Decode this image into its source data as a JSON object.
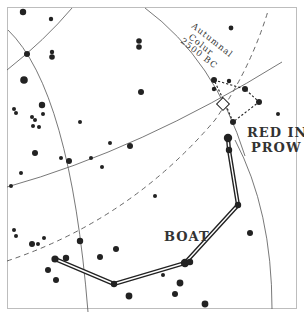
{
  "diagram": {
    "type": "star-chart",
    "labels": {
      "colure_line1": "Autumnal",
      "colure_line2": "Colur",
      "colure_line3": "2500 BC",
      "red_in_prow_line1": "RED IN",
      "red_in_prow_line2": "PROW",
      "boat": "BOAT"
    },
    "colors": {
      "ink": "#222222",
      "grid": "#555555",
      "frame": "#bdbdbd",
      "background": "#ffffff"
    },
    "stars": [
      {
        "x": 23,
        "y": 12,
        "r": 3.2
      },
      {
        "x": 51,
        "y": 19,
        "r": 2.2
      },
      {
        "x": 27,
        "y": 54,
        "r": 3.0
      },
      {
        "x": 52,
        "y": 52,
        "r": 2.2
      },
      {
        "x": 52,
        "y": 57,
        "r": 2.8
      },
      {
        "x": 24,
        "y": 80,
        "r": 3.8
      },
      {
        "x": 139,
        "y": 41,
        "r": 2.8
      },
      {
        "x": 139,
        "y": 47,
        "r": 2.8
      },
      {
        "x": 141,
        "y": 92,
        "r": 3.0
      },
      {
        "x": 42,
        "y": 105,
        "r": 3.2
      },
      {
        "x": 14,
        "y": 109,
        "r": 2.0
      },
      {
        "x": 16,
        "y": 113,
        "r": 2.0
      },
      {
        "x": 43,
        "y": 114,
        "r": 2.0
      },
      {
        "x": 32,
        "y": 117,
        "r": 2.0
      },
      {
        "x": 35,
        "y": 120,
        "r": 2.0
      },
      {
        "x": 33,
        "y": 126,
        "r": 2.0
      },
      {
        "x": 39,
        "y": 127,
        "r": 2.0
      },
      {
        "x": 80,
        "y": 122,
        "r": 2.0
      },
      {
        "x": 110,
        "y": 143,
        "r": 2.0
      },
      {
        "x": 130,
        "y": 146,
        "r": 3.0
      },
      {
        "x": 35,
        "y": 153,
        "r": 3.0
      },
      {
        "x": 61,
        "y": 158,
        "r": 2.0
      },
      {
        "x": 69,
        "y": 161,
        "r": 3.0
      },
      {
        "x": 91,
        "y": 158,
        "r": 2.0
      },
      {
        "x": 102,
        "y": 167,
        "r": 2.0
      },
      {
        "x": 21,
        "y": 173,
        "r": 2.0
      },
      {
        "x": 11,
        "y": 186,
        "r": 2.0
      },
      {
        "x": 231,
        "y": 28,
        "r": 2.4
      },
      {
        "x": 214,
        "y": 80,
        "r": 3.0
      },
      {
        "x": 229,
        "y": 81,
        "r": 2.2
      },
      {
        "x": 245,
        "y": 89,
        "r": 3.0
      },
      {
        "x": 214,
        "y": 89,
        "r": 2.2
      },
      {
        "x": 259,
        "y": 102,
        "r": 3.0
      },
      {
        "x": 278,
        "y": 114,
        "r": 2.0
      },
      {
        "x": 233,
        "y": 122,
        "r": 3.0
      },
      {
        "x": 228,
        "y": 138,
        "r": 4.2
      },
      {
        "x": 229,
        "y": 150,
        "r": 3.2
      },
      {
        "x": 238,
        "y": 205,
        "r": 3.2
      },
      {
        "x": 155,
        "y": 196,
        "r": 2.0
      },
      {
        "x": 250,
        "y": 233,
        "r": 3.0
      },
      {
        "x": 14,
        "y": 230,
        "r": 2.0
      },
      {
        "x": 16,
        "y": 236,
        "r": 2.0
      },
      {
        "x": 32,
        "y": 244,
        "r": 3.0
      },
      {
        "x": 38,
        "y": 244,
        "r": 2.0
      },
      {
        "x": 44,
        "y": 238,
        "r": 2.0
      },
      {
        "x": 80,
        "y": 241,
        "r": 3.2
      },
      {
        "x": 55,
        "y": 259,
        "r": 3.6
      },
      {
        "x": 66,
        "y": 258,
        "r": 3.2
      },
      {
        "x": 100,
        "y": 257,
        "r": 3.0
      },
      {
        "x": 116,
        "y": 249,
        "r": 3.0
      },
      {
        "x": 48,
        "y": 270,
        "r": 3.0
      },
      {
        "x": 56,
        "y": 280,
        "r": 3.0
      },
      {
        "x": 114,
        "y": 284,
        "r": 3.2
      },
      {
        "x": 129,
        "y": 296,
        "r": 3.4
      },
      {
        "x": 185,
        "y": 263,
        "r": 4.2
      },
      {
        "x": 190,
        "y": 262,
        "r": 3.2
      },
      {
        "x": 163,
        "y": 275,
        "r": 2.0
      },
      {
        "x": 180,
        "y": 283,
        "r": 3.4
      },
      {
        "x": 175,
        "y": 294,
        "r": 3.0
      },
      {
        "x": 205,
        "y": 304,
        "r": 3.4
      }
    ],
    "boat_path": [
      [
        55,
        259
      ],
      [
        114,
        284
      ],
      [
        185,
        263
      ],
      [
        238,
        205
      ],
      [
        229,
        150
      ],
      [
        228,
        138
      ]
    ],
    "prow_dotted": [
      [
        214,
        80
      ],
      [
        245,
        89
      ],
      [
        259,
        102
      ],
      [
        233,
        122
      ],
      [
        225,
        103
      ],
      [
        214,
        80
      ]
    ],
    "equinox_marker": {
      "x": 223,
      "y": 104,
      "size": 9,
      "rotation": 45
    }
  }
}
